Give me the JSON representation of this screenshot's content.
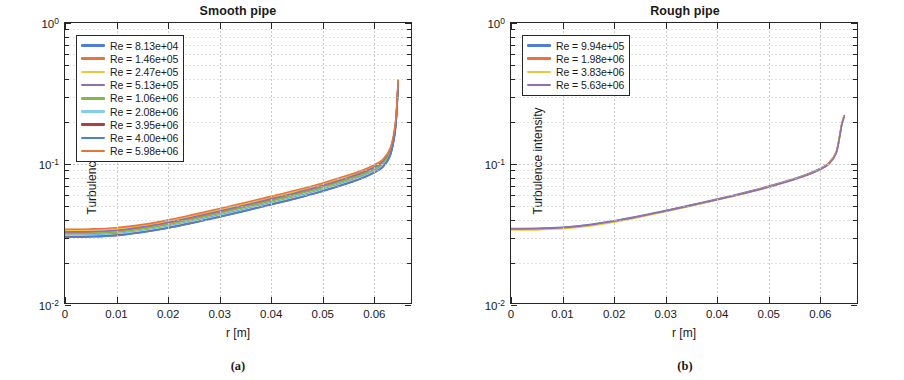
{
  "figure": {
    "panels": [
      {
        "key": "smooth",
        "title": "Smooth pipe",
        "sublabel": "(a)",
        "legend": [
          {
            "label": "Re = 8.13e+04",
            "color": "#4f7fd4"
          },
          {
            "label": "Re = 1.46e+05",
            "color": "#e8743b"
          },
          {
            "label": "Re = 2.47e+05",
            "color": "#f2c53d"
          },
          {
            "label": "Re = 5.13e+05",
            "color": "#8e6fb0"
          },
          {
            "label": "Re = 1.06e+06",
            "color": "#82b74b"
          },
          {
            "label": "Re = 2.08e+06",
            "color": "#84cfe8"
          },
          {
            "label": "Re = 3.95e+06",
            "color": "#a8443c"
          },
          {
            "label": "Re = 4.00e+06",
            "color": "#4f7fd4"
          },
          {
            "label": "Re = 5.98e+06",
            "color": "#e8743b"
          }
        ]
      },
      {
        "key": "rough",
        "title": "Rough pipe",
        "sublabel": "(b)",
        "legend": [
          {
            "label": "Re = 9.94e+05",
            "color": "#4f7fd4"
          },
          {
            "label": "Re = 1.98e+06",
            "color": "#e8743b"
          },
          {
            "label": "Re = 3.83e+06",
            "color": "#f2c53d"
          },
          {
            "label": "Re = 5.63e+06",
            "color": "#8e6fb0"
          }
        ]
      }
    ]
  },
  "chart_data": [
    {
      "type": "line",
      "panel": "a",
      "title": "Smooth pipe",
      "xlabel": "r [m]",
      "ylabel": "Turbulence intensity",
      "xlim": [
        0,
        0.0675
      ],
      "ylim": [
        0.01,
        1
      ],
      "yscale": "log",
      "xscale": "linear",
      "xticks": [
        0,
        0.01,
        0.02,
        0.03,
        0.04,
        0.05,
        0.06
      ],
      "xticklabels": [
        "0",
        "0.01",
        "0.02",
        "0.03",
        "0.04",
        "0.05",
        "0.06"
      ],
      "yticks": [
        0.01,
        0.1,
        1
      ],
      "yticklabels": [
        "10-2",
        "10-1",
        "100"
      ],
      "grid": true,
      "legend_position": "upper left",
      "x": [
        0,
        0.005,
        0.01,
        0.015,
        0.02,
        0.025,
        0.03,
        0.035,
        0.04,
        0.045,
        0.05,
        0.055,
        0.058,
        0.06,
        0.062,
        0.0635,
        0.0645,
        0.065
      ],
      "series": [
        {
          "name": "Re = 8.13e+04",
          "color": "#4f7fd4",
          "values": [
            0.0305,
            0.0306,
            0.0312,
            0.0328,
            0.0352,
            0.0385,
            0.0424,
            0.0468,
            0.0518,
            0.0575,
            0.0645,
            0.0735,
            0.0805,
            0.0868,
            0.0965,
            0.118,
            0.185,
            0.375
          ]
        },
        {
          "name": "Re = 1.46e+05",
          "color": "#e8743b",
          "values": [
            0.0318,
            0.032,
            0.0327,
            0.0344,
            0.037,
            0.0404,
            0.0444,
            0.049,
            0.0542,
            0.0602,
            0.0675,
            0.0768,
            0.084,
            0.0905,
            0.1005,
            0.1225,
            0.191,
            0.382
          ]
        },
        {
          "name": "Re = 2.47e+05",
          "color": "#f2c53d",
          "values": [
            0.033,
            0.0332,
            0.0339,
            0.0357,
            0.0384,
            0.042,
            0.0462,
            0.051,
            0.0564,
            0.0626,
            0.0702,
            0.0798,
            0.0872,
            0.094,
            0.1042,
            0.1268,
            0.1965,
            0.389
          ]
        },
        {
          "name": "Re = 5.13e+05",
          "color": "#8e6fb0",
          "values": [
            0.0322,
            0.0324,
            0.0331,
            0.0349,
            0.0376,
            0.0411,
            0.0452,
            0.0499,
            0.0552,
            0.0613,
            0.0687,
            0.0782,
            0.0855,
            0.0922,
            0.1022,
            0.1245,
            0.1935,
            0.3855
          ]
        },
        {
          "name": "Re = 1.06e+06",
          "color": "#82b74b",
          "values": [
            0.0312,
            0.0314,
            0.0321,
            0.0338,
            0.0363,
            0.0397,
            0.0436,
            0.0482,
            0.0533,
            0.0592,
            0.0663,
            0.0755,
            0.0825,
            0.089,
            0.0988,
            0.1205,
            0.1882,
            0.3785
          ]
        },
        {
          "name": "Re = 2.08e+06",
          "color": "#84cfe8",
          "values": [
            0.0302,
            0.0304,
            0.031,
            0.0326,
            0.035,
            0.0382,
            0.042,
            0.0464,
            0.0514,
            0.057,
            0.0639,
            0.0728,
            0.0797,
            0.086,
            0.0955,
            0.1168,
            0.1835,
            0.3725
          ]
        },
        {
          "name": "Re = 3.95e+06",
          "color": "#a8443c",
          "values": [
            0.0296,
            0.0298,
            0.0304,
            0.032,
            0.0343,
            0.0374,
            0.0411,
            0.0454,
            0.0503,
            0.0558,
            0.0626,
            0.0713,
            0.0781,
            0.0843,
            0.0937,
            0.1148,
            0.1808,
            0.369
          ]
        },
        {
          "name": "Re = 4.00e+06",
          "color": "#4f7fd4",
          "values": [
            0.0295,
            0.0297,
            0.0303,
            0.0319,
            0.0342,
            0.0373,
            0.041,
            0.0453,
            0.0501,
            0.0556,
            0.0624,
            0.0711,
            0.0779,
            0.0841,
            0.0935,
            0.1145,
            0.1805,
            0.3685
          ]
        },
        {
          "name": "Re = 5.98e+06",
          "color": "#e8743b",
          "values": [
            0.0336,
            0.0338,
            0.0345,
            0.0363,
            0.0391,
            0.0428,
            0.0471,
            0.052,
            0.0575,
            0.0638,
            0.0715,
            0.0813,
            0.0888,
            0.0957,
            0.106,
            0.129,
            0.1995,
            0.393
          ]
        }
      ]
    },
    {
      "type": "line",
      "panel": "b",
      "title": "Rough pipe",
      "xlabel": "r [m]",
      "ylabel": "Turbulence intensity",
      "xlim": [
        0,
        0.0675
      ],
      "ylim": [
        0.01,
        1
      ],
      "yscale": "log",
      "xscale": "linear",
      "xticks": [
        0,
        0.01,
        0.02,
        0.03,
        0.04,
        0.05,
        0.06
      ],
      "xticklabels": [
        "0",
        "0.01",
        "0.02",
        "0.03",
        "0.04",
        "0.05",
        "0.06"
      ],
      "yticks": [
        0.01,
        0.1,
        1
      ],
      "yticklabels": [
        "10-2",
        "10-1",
        "100"
      ],
      "grid": true,
      "legend_position": "upper left",
      "x": [
        0,
        0.005,
        0.01,
        0.015,
        0.02,
        0.025,
        0.03,
        0.035,
        0.04,
        0.045,
        0.05,
        0.055,
        0.058,
        0.06,
        0.062,
        0.0635,
        0.0645,
        0.065
      ],
      "series": [
        {
          "name": "Re = 9.94e+05",
          "color": "#4f7fd4",
          "values": [
            0.034,
            0.0341,
            0.0347,
            0.0362,
            0.0386,
            0.0418,
            0.0456,
            0.05,
            0.055,
            0.0608,
            0.0678,
            0.0768,
            0.0838,
            0.0902,
            0.1,
            0.1215,
            0.188,
            0.218
          ]
        },
        {
          "name": "Re = 1.98e+06",
          "color": "#e8743b",
          "values": [
            0.0336,
            0.0337,
            0.0343,
            0.0358,
            0.0382,
            0.0414,
            0.0452,
            0.0496,
            0.0546,
            0.0603,
            0.0673,
            0.0763,
            0.0832,
            0.0896,
            0.0993,
            0.1207,
            0.1868,
            0.216
          ]
        },
        {
          "name": "Re = 3.83e+06",
          "color": "#f2c53d",
          "values": [
            0.0332,
            0.0333,
            0.0339,
            0.0354,
            0.0378,
            0.041,
            0.0448,
            0.0492,
            0.0542,
            0.0599,
            0.0668,
            0.0758,
            0.0827,
            0.089,
            0.0987,
            0.12,
            0.1858,
            0.2145
          ]
        },
        {
          "name": "Re = 5.63e+06",
          "color": "#8e6fb0",
          "values": [
            0.0338,
            0.0339,
            0.0345,
            0.036,
            0.0384,
            0.0415,
            0.0453,
            0.0496,
            0.0545,
            0.0601,
            0.0669,
            0.0757,
            0.0824,
            0.0886,
            0.0981,
            0.119,
            0.1845,
            0.213
          ]
        }
      ]
    }
  ]
}
